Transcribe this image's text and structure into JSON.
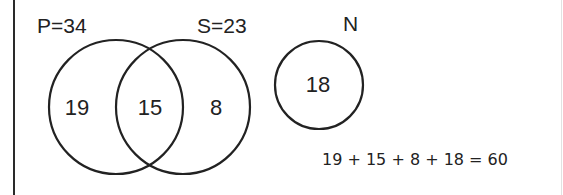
{
  "diagram": {
    "type": "venn",
    "sets": [
      {
        "name": "P",
        "label": "P=34",
        "total": 34
      },
      {
        "name": "S",
        "label": "S=23",
        "total": 23
      },
      {
        "name": "N",
        "label": "N",
        "total": 18
      }
    ],
    "regions": {
      "p_only": "19",
      "p_and_s": "15",
      "s_only": "8",
      "n_only": "18"
    },
    "equation": "19 + 15 + 8 + 18 = 60",
    "colors": {
      "stroke": "#222222",
      "background": "#ffffff"
    }
  }
}
